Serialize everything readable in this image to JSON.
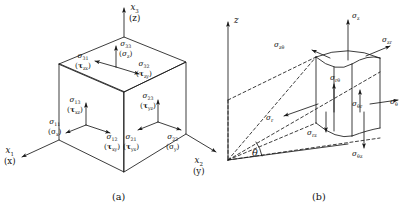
{
  "figure": {
    "background": "#ffffff",
    "ink": "#1a1a1a",
    "captions": [
      {
        "id": "caption-a",
        "text": "(a)"
      },
      {
        "id": "caption-b",
        "text": "(b)"
      }
    ]
  },
  "panel_a": {
    "name": "cartesian-stress-cube",
    "axes": [
      {
        "name": "axis-x3",
        "primary": "x",
        "sub": "3",
        "alt": "(z)"
      },
      {
        "name": "axis-x1",
        "primary": "x",
        "sub": "1",
        "alt": "(x)"
      },
      {
        "name": "axis-x2",
        "primary": "x",
        "sub": "2",
        "alt": "(y)"
      }
    ],
    "top_face": [
      {
        "name": "sigma-33",
        "sym": "σ",
        "sub": "33",
        "alt_sym": "σ",
        "alt_sub": "z",
        "alt_tau": false,
        "dir": "up"
      },
      {
        "name": "sigma-31",
        "sym": "σ",
        "sub": "31",
        "alt_sym": "τ",
        "alt_sub": "zx",
        "alt_tau": true,
        "dir": "left"
      },
      {
        "name": "sigma-32",
        "sym": "σ",
        "sub": "32",
        "alt_sym": "τ",
        "alt_sub": "zy",
        "alt_tau": true,
        "dir": "right"
      }
    ],
    "left_face": [
      {
        "name": "sigma-13",
        "sym": "σ",
        "sub": "13",
        "alt_sym": "τ",
        "alt_sub": "xz",
        "alt_tau": true,
        "dir": "up"
      },
      {
        "name": "sigma-11",
        "sym": "σ",
        "sub": "11",
        "alt_sym": "σ",
        "alt_sub": "x",
        "alt_tau": false,
        "dir": "left"
      },
      {
        "name": "sigma-12",
        "sym": "σ",
        "sub": "12",
        "alt_sym": "τ",
        "alt_sub": "xy",
        "alt_tau": true,
        "dir": "right"
      }
    ],
    "right_face": [
      {
        "name": "sigma-23",
        "sym": "σ",
        "sub": "23",
        "alt_sym": "τ",
        "alt_sub": "yz",
        "alt_tau": true,
        "dir": "up"
      },
      {
        "name": "sigma-21",
        "sym": "σ",
        "sub": "21",
        "alt_sym": "τ",
        "alt_sub": "yx",
        "alt_tau": true,
        "dir": "left"
      },
      {
        "name": "sigma-22",
        "sym": "σ",
        "sub": "22",
        "alt_sym": "σ",
        "alt_sub": "y",
        "alt_tau": false,
        "dir": "right"
      }
    ]
  },
  "panel_b": {
    "name": "cylindrical-stress-element",
    "axis_z": {
      "name": "axis-z",
      "text": "z"
    },
    "angle": {
      "name": "angle-theta",
      "text": "θ"
    },
    "components": [
      {
        "name": "sigma-z",
        "sym": "σ",
        "sub": "z",
        "dir": "up"
      },
      {
        "name": "sigma-z-theta",
        "sym": "σ",
        "sub": "zθ",
        "dir": "left"
      },
      {
        "name": "sigma-z-r",
        "sym": "σ",
        "sub": "zr",
        "dir": "right"
      },
      {
        "name": "sigma-r",
        "sym": "σ",
        "sub": "r",
        "dir": "left"
      },
      {
        "name": "sigma-r-theta",
        "sym": "σ",
        "sub": "rθ",
        "dir": "up"
      },
      {
        "name": "sigma-r-z",
        "sym": "σ",
        "sub": "rz",
        "dir": "down"
      },
      {
        "name": "sigma-theta",
        "sym": "σ",
        "sub": "θ",
        "dir": "right"
      },
      {
        "name": "sigma-theta-r",
        "sym": "σ",
        "sub": "θr",
        "dir": "up"
      },
      {
        "name": "sigma-theta-z",
        "sym": "σ",
        "sub": "θz",
        "dir": "down"
      }
    ]
  }
}
